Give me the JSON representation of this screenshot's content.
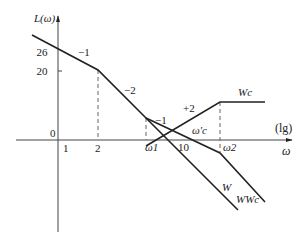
{
  "diagram": {
    "type": "bode-asymptotic-magnitude",
    "y_axis_label": "L(ω)",
    "x_axis_label": "ω",
    "x_scale_label": "(lg)",
    "origin_label": "0",
    "y_ticks": [
      "26",
      "20"
    ],
    "x_ticks": [
      "1",
      "2",
      "ω1",
      "10",
      "ω2"
    ],
    "crossover_label": "ω'c",
    "slope_labels": [
      "−1",
      "−2",
      "−1",
      "+2"
    ],
    "curve_labels": {
      "W": "W",
      "Wc": "Wc",
      "WWc": "WWc"
    }
  }
}
